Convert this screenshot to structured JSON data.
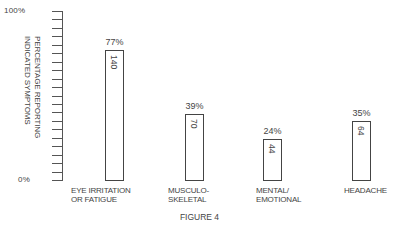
{
  "chart_data": {
    "type": "bar",
    "title": "",
    "caption": "FIGURE 4",
    "xlabel": "",
    "ylabel": "PERCENTAGE REPORTING INDICATED SYMPTOMS",
    "ylim": [
      0,
      100
    ],
    "ytick_labels": [
      "0%",
      "100%"
    ],
    "minor_tick_count": 20,
    "grid": false,
    "legend": null,
    "categories": [
      "EYE IRRITATION OR FATIGUE",
      "MUSCULO-SKELETAL",
      "MENTAL/EMOTIONAL",
      "HEADACHE"
    ],
    "values": [
      77,
      39,
      24,
      35
    ],
    "value_labels": [
      "77%",
      "39%",
      "24%",
      "35%"
    ],
    "counts": [
      140,
      70,
      44,
      64
    ]
  },
  "labels": {
    "y_top": "100%",
    "y_bottom": "0%",
    "axis_title": "PERCENTAGE REPORTING\nINDICATED SYMPTOMS",
    "cat0": "EYE IRRITATION\nOR FATIGUE",
    "cat1": "MUSCULO-\nSKELETAL",
    "cat2": "MENTAL/\nEMOTIONAL",
    "cat3": "HEADACHE",
    "figure": "FIGURE 4"
  }
}
